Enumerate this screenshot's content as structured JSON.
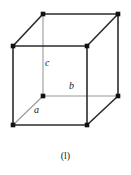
{
  "figure": {
    "caption": "(l)",
    "type": "crystal-unit-cell",
    "colors": {
      "background": "#ffffff",
      "edge_front": "#2b2b2b",
      "edge_hidden": "#9a9a9a",
      "vertex": "#111111",
      "text": "#1a1a1a"
    },
    "labels": {
      "a": "a",
      "b": "b",
      "c": "c"
    },
    "geometry": {
      "units": "px",
      "viewbox": [
        0,
        0,
        131,
        150
      ],
      "vertices": [
        {
          "name": "front-top-left",
          "x": 13,
          "y": 46
        },
        {
          "name": "front-top-right",
          "x": 87,
          "y": 46
        },
        {
          "name": "front-bottom-left",
          "x": 13,
          "y": 125
        },
        {
          "name": "front-bottom-right",
          "x": 87,
          "y": 125
        },
        {
          "name": "back-top-left",
          "x": 43,
          "y": 14
        },
        {
          "name": "back-top-right",
          "x": 118,
          "y": 14
        },
        {
          "name": "back-bottom-left",
          "x": 43,
          "y": 96
        },
        {
          "name": "back-bottom-right",
          "x": 118,
          "y": 96
        }
      ],
      "solid_edges": [
        [
          "front-top-left",
          "front-top-right"
        ],
        [
          "front-top-left",
          "front-bottom-left"
        ],
        [
          "front-bottom-left",
          "front-bottom-right"
        ],
        [
          "front-top-right",
          "front-bottom-right"
        ],
        [
          "front-top-left",
          "back-top-left"
        ],
        [
          "front-top-right",
          "back-top-right"
        ],
        [
          "front-bottom-right",
          "back-bottom-right"
        ],
        [
          "back-top-left",
          "back-top-right"
        ],
        [
          "back-top-right",
          "back-bottom-right"
        ]
      ],
      "hidden_edges": [
        [
          "back-bottom-left",
          "back-bottom-right"
        ],
        [
          "back-bottom-left",
          "back-top-left"
        ],
        [
          "front-bottom-left",
          "back-bottom-left"
        ]
      ],
      "label_anchors": {
        "a": {
          "x": 34,
          "y": 105,
          "edge": [
            "front-bottom-left",
            "back-bottom-left"
          ]
        },
        "b": {
          "x": 69,
          "y": 81,
          "edge": [
            "back-bottom-left",
            "back-bottom-right"
          ]
        },
        "c": {
          "x": 45,
          "y": 58,
          "edge": [
            "back-bottom-left",
            "back-top-left"
          ]
        }
      }
    }
  }
}
